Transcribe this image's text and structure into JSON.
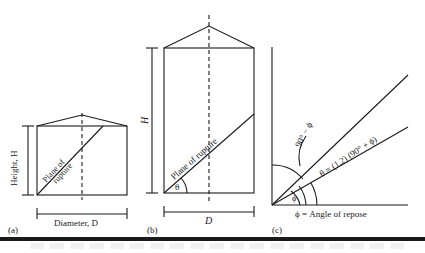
{
  "figure": {
    "panel_a": {
      "tag": "(a)",
      "height_label": "Height, H",
      "diameter_label": "Diameter, D",
      "plane_label_line1": "Plane of",
      "plane_label_line2": "rupture"
    },
    "panel_b": {
      "tag": "(b)",
      "height_label": "H",
      "diameter_label": "D",
      "plane_label": "Plane of rupture",
      "angle_label": "θ"
    },
    "panel_c": {
      "tag": "(c)",
      "complement_label": "90° − ϕ",
      "theta_formula": "θ = (1,2) (90° + ϕ)",
      "phi_label": "ϕ",
      "repose_label": "ϕ = Angle of repose"
    }
  }
}
